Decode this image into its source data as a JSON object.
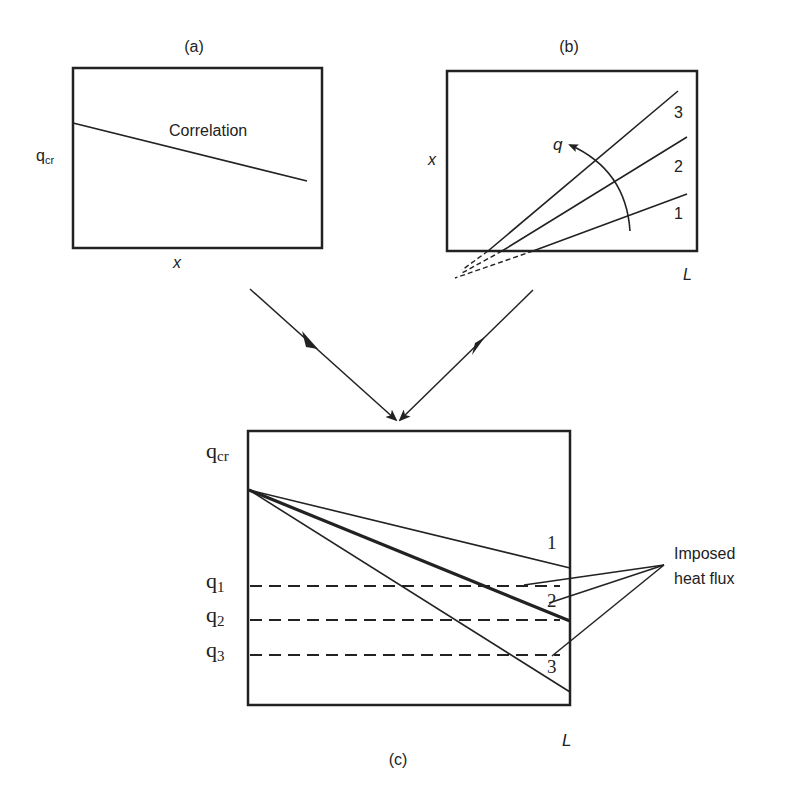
{
  "figure": {
    "panel_a": {
      "label": "(a)",
      "y_axis_label": "q",
      "y_axis_sub": "cr",
      "x_axis_label": "x",
      "curve_label": "Correlation"
    },
    "panel_b": {
      "label": "(b)",
      "y_axis_label": "x",
      "x_axis_label": "L",
      "arrow_label": "q",
      "line_labels": [
        "1",
        "2",
        "3"
      ]
    },
    "panel_c": {
      "label": "(c)",
      "x_axis_label": "L",
      "y_axis_labels": [
        {
          "base": "q",
          "sub": "cr"
        },
        {
          "base": "q",
          "sub": "1"
        },
        {
          "base": "q",
          "sub": "2"
        },
        {
          "base": "q",
          "sub": "3"
        }
      ],
      "line_labels": [
        "1",
        "2",
        "3"
      ],
      "annotation_line1": "Imposed",
      "annotation_line2": "heat flux"
    },
    "colors": {
      "ink": "#222222",
      "background": "#ffffff"
    }
  }
}
